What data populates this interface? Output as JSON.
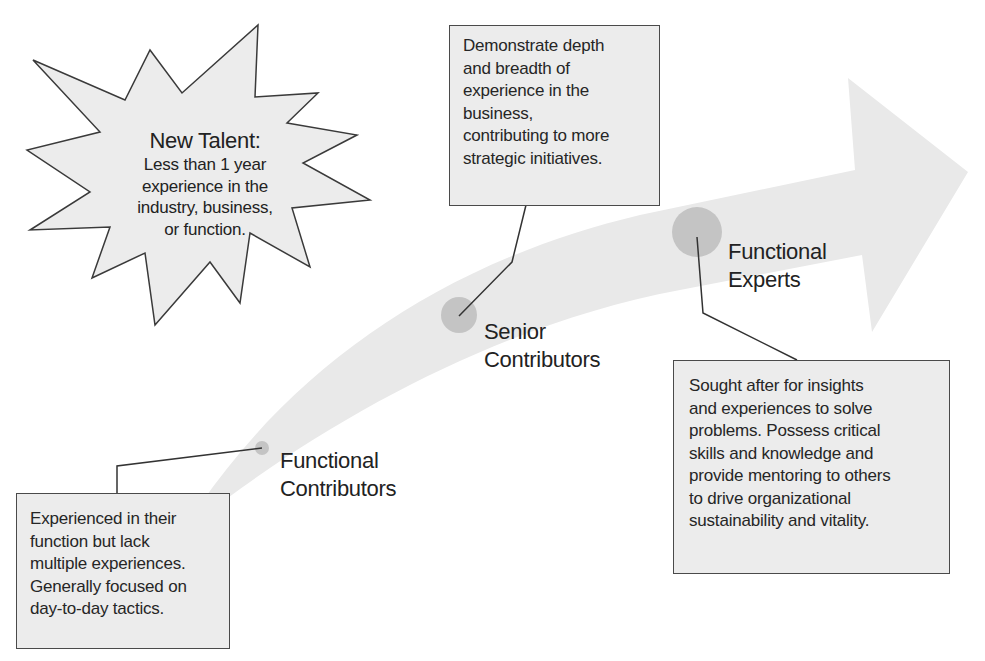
{
  "diagram": {
    "type": "career-progression-arrow",
    "colors": {
      "arrow_fill": "#e9e9e9",
      "box_fill": "#ececec",
      "box_border": "#4a4a4a",
      "node_fill": "#bdbdbd",
      "text": "#222222"
    },
    "new_talent": {
      "title": "New Talent:",
      "lines": [
        "Less than 1 year",
        "experience in the",
        "industry, business,",
        "or function."
      ]
    },
    "stages": [
      {
        "name": "Functional Contributors",
        "label_lines": [
          "Functional",
          "Contributors"
        ],
        "description_lines": [
          "Experienced in their",
          "function but lack",
          "multiple experiences.",
          "Generally focused on",
          "day-to-day tactics."
        ]
      },
      {
        "name": "Senior Contributors",
        "label_lines": [
          "Senior",
          "Contributors"
        ],
        "description_lines": [
          "Demonstrate depth",
          "and breadth of",
          "experience in the",
          "business,",
          "contributing to more",
          "strategic initiatives."
        ]
      },
      {
        "name": "Functional Experts",
        "label_lines": [
          "Functional",
          "Experts"
        ],
        "description_lines": [
          "Sought after for  insights",
          "and experiences to solve",
          "problems. Possess critical",
          "skills and knowledge and",
          "provide mentoring to others",
          "to drive organizational",
          "sustainability and vitality."
        ]
      }
    ]
  }
}
